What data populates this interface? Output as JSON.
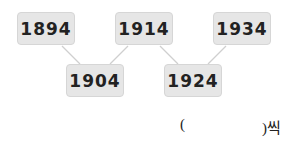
{
  "diagram": {
    "top_row": [
      "1894",
      "1914",
      "1934"
    ],
    "bottom_row": [
      "1904",
      "1924"
    ],
    "colors": {
      "box_fill": "#e6e6e6",
      "box_border": "#d6d6d6",
      "connector": "#cfcfcf",
      "text": "#222222"
    }
  },
  "answer": {
    "open_paren": "(",
    "close_suffix": ")씩"
  }
}
